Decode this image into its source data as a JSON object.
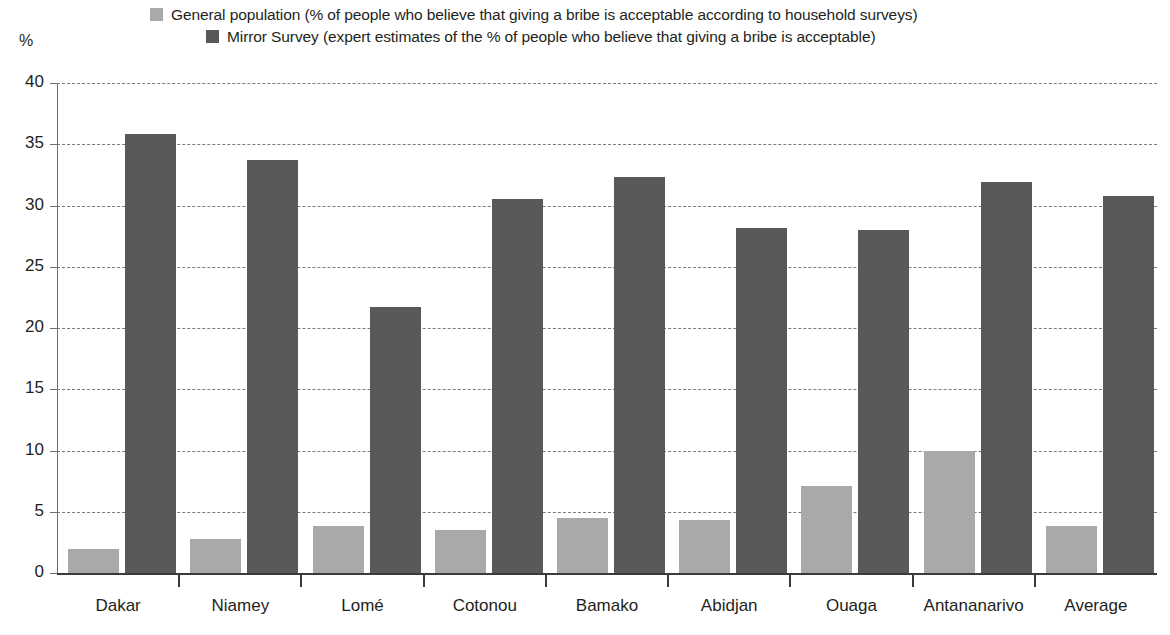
{
  "legend": {
    "entries": [
      {
        "label": "General population (% of people who believe that giving a bribe is acceptable according to household surveys)",
        "color": "#a9a9a9",
        "key": "general-population"
      },
      {
        "label": "Mirror Survey (expert estimates of the % of people who believe that giving a bribe is acceptable)",
        "color": "#595959",
        "key": "mirror-survey"
      }
    ]
  },
  "axes": {
    "unit_label": "%",
    "y_ticks": [
      "0",
      "5",
      "10",
      "15",
      "20",
      "25",
      "30",
      "35",
      "40"
    ]
  },
  "chart_data": {
    "type": "bar",
    "title": "",
    "xlabel": "",
    "ylabel": "%",
    "ylim": [
      0,
      40
    ],
    "ytick_step": 5,
    "grid": true,
    "legend_position": "top",
    "categories": [
      "Dakar",
      "Niamey",
      "Lomé",
      "Cotonou",
      "Bamako",
      "Abidjan",
      "Ouaga",
      "Antananarivo",
      "Average"
    ],
    "series": [
      {
        "name": "General population (% of people who believe that giving a bribe is acceptable according to household surveys)",
        "short_name": "General population",
        "color": "#a9a9a9",
        "values": [
          2.0,
          2.8,
          3.8,
          3.5,
          4.5,
          4.3,
          7.1,
          10.0,
          3.8
        ]
      },
      {
        "name": "Mirror Survey (expert estimates of the % of people who believe that giving a bribe is acceptable)",
        "short_name": "Mirror Survey",
        "color": "#595959",
        "values": [
          35.8,
          33.7,
          21.7,
          30.5,
          32.3,
          28.2,
          28.0,
          31.9,
          30.8
        ]
      }
    ]
  }
}
